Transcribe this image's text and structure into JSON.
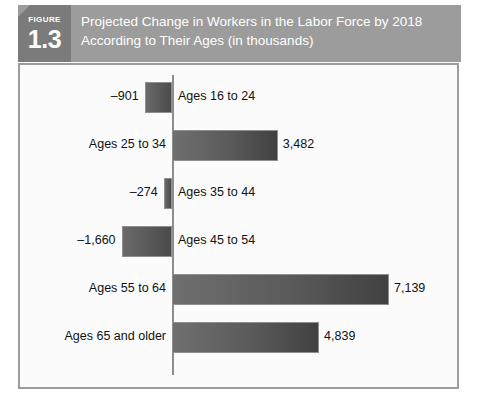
{
  "figure": {
    "badge_word": "FIGURE",
    "badge_number": "1.3",
    "title_line1": "Projected Change in Workers in the Labor Force by 2018",
    "title_line2": "According to Their Ages (in thousands)",
    "band_color": "#9c9c9c",
    "badge_color": "#7b7b7b",
    "frame_color": "#9c9c9c",
    "bar_color": "#5a5a5a"
  },
  "chart_data": {
    "type": "bar",
    "orientation": "horizontal",
    "title": "Projected Change in Workers in the Labor Force by 2018 According to Their Ages (in thousands)",
    "xlabel": "",
    "ylabel": "",
    "units": "thousands",
    "grid": false,
    "legend": "none",
    "axis_zero": true,
    "xlim": [
      -1660,
      7139
    ],
    "categories": [
      "Ages 16 to 24",
      "Ages 25 to 34",
      "Ages 35 to 44",
      "Ages 45 to 54",
      "Ages 55 to 64",
      "Ages 65 and older"
    ],
    "values": [
      -901,
      3482,
      -274,
      -1660,
      7139,
      4839
    ],
    "value_labels": [
      "–901",
      "3,482",
      "–274",
      "–1,660",
      "7,139",
      "4,839"
    ],
    "bars": [
      {
        "category": "Ages 16 to 24",
        "value": -901,
        "value_label": "–901",
        "sign": "negative",
        "cat_side": "right",
        "val_side": "left"
      },
      {
        "category": "Ages 25 to 34",
        "value": 3482,
        "value_label": "3,482",
        "sign": "positive",
        "cat_side": "left",
        "val_side": "right"
      },
      {
        "category": "Ages 35 to 44",
        "value": -274,
        "value_label": "–274",
        "sign": "negative",
        "cat_side": "right",
        "val_side": "left"
      },
      {
        "category": "Ages 45 to 54",
        "value": -1660,
        "value_label": "–1,660",
        "sign": "negative",
        "cat_side": "right",
        "val_side": "left"
      },
      {
        "category": "Ages 55 to 64",
        "value": 7139,
        "value_label": "7,139",
        "sign": "positive",
        "cat_side": "left",
        "val_side": "right"
      },
      {
        "category": "Ages 65 and older",
        "value": 4839,
        "value_label": "4,839",
        "sign": "positive",
        "cat_side": "left",
        "val_side": "right"
      }
    ]
  }
}
